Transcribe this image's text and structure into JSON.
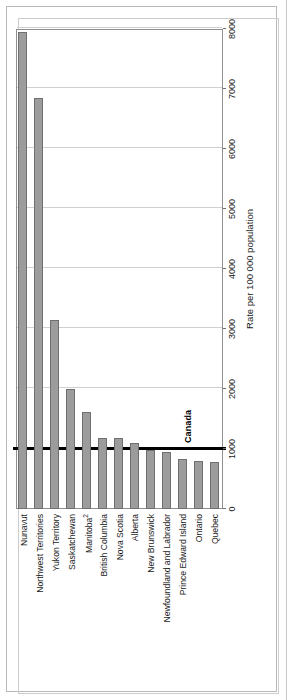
{
  "chart_data": {
    "type": "bar",
    "orientation": "horizontal",
    "title": "",
    "xlabel": "Rate per 100 000 population",
    "ylabel": "",
    "xlim": [
      0,
      8000
    ],
    "xticks": [
      0,
      1000,
      2000,
      3000,
      4000,
      5000,
      6000,
      7000,
      8000
    ],
    "grid": "vertical",
    "legend": "none",
    "categories": [
      "Nunavut",
      "Northwest Territories",
      "Yukon Territory",
      "Saskatchewan",
      "Manitoba2",
      "British Columbia",
      "Nova Scotia",
      "Alberta",
      "New Brunswick",
      "Newfoundland and Labrador",
      "Prince Edward Island",
      "Ontario",
      "Quebec"
    ],
    "values": [
      7950,
      6850,
      3150,
      2000,
      1620,
      1180,
      1175,
      1095,
      975,
      955,
      840,
      800,
      775
    ],
    "reference_line": {
      "label": "Canada",
      "value": 1000,
      "color": "#000000"
    },
    "bar_color": "#9c9c9c",
    "bar_edge_color": "#6f6f6f"
  },
  "chart": {
    "axis_title": "Rate per 100 000 population",
    "canada_label": "Canada",
    "tick_labels": [
      "0",
      "1000",
      "2000",
      "3000",
      "4000",
      "5000",
      "6000",
      "7000",
      "8000"
    ],
    "category_labels": [
      "Nunavut",
      "Northwest Territories",
      "Yukon Territory",
      "Saskatchewan",
      "Manitoba",
      "British Columbia",
      "Nova Scotia",
      "Alberta",
      "New Brunswick",
      "Newfoundland and Labrador",
      "Prince Edward Island",
      "Ontario",
      "Quebec"
    ],
    "manitoba_footnote": "2"
  },
  "page": {
    "source_strip": ""
  }
}
